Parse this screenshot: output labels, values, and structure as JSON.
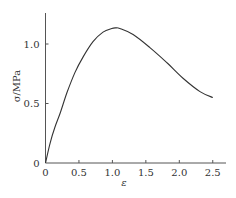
{
  "chart_data": {
    "type": "line",
    "title": "",
    "xlabel": "ε",
    "ylabel": "σ/MPa",
    "xlim": [
      0,
      2.6
    ],
    "ylim": [
      0,
      1.25
    ],
    "grid": false,
    "legend": null,
    "x_ticks": [
      0,
      0.5,
      1.0,
      1.5,
      2.0,
      2.5
    ],
    "x_tick_labels": [
      "0",
      "0.5",
      "1.0",
      "1.5",
      "2.0",
      "2.5"
    ],
    "y_ticks": [
      0,
      0.5,
      1.0
    ],
    "y_tick_labels": [
      "0",
      "0.5",
      "1.0"
    ],
    "series": [
      {
        "name": "stress-strain",
        "color": "#333333",
        "x": [
          0,
          0.07,
          0.14,
          0.22,
          0.32,
          0.44,
          0.56,
          0.71,
          0.86,
          0.99,
          1.05,
          1.11,
          1.31,
          1.56,
          1.82,
          2.06,
          2.31,
          2.5
        ],
        "y": [
          0,
          0.17,
          0.3,
          0.42,
          0.59,
          0.76,
          0.89,
          1.02,
          1.1,
          1.13,
          1.135,
          1.13,
          1.08,
          0.97,
          0.84,
          0.71,
          0.6,
          0.55
        ]
      }
    ]
  },
  "layout": {
    "origin_px": [
      45.5,
      163
    ],
    "x_px_per_unit": 66.9,
    "y_px_per_unit": 119,
    "x_axis_end_px": 226,
    "y_axis_top_px": 13
  }
}
